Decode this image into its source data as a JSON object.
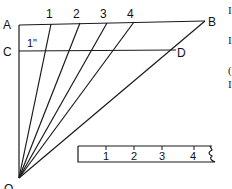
{
  "diagram": {
    "points": {
      "A": {
        "label": "A",
        "x": 19,
        "y": 25
      },
      "B": {
        "label": "B",
        "x": 205,
        "y": 21
      },
      "C": {
        "label": "C",
        "x": 19,
        "y": 51
      },
      "D": {
        "label": "D",
        "x": 176,
        "y": 50
      },
      "O": {
        "label": "O",
        "x": 19,
        "y": 180
      }
    },
    "division_labels": [
      "1",
      "2",
      "3",
      "4"
    ],
    "inch_label": "1\"",
    "ruler": {
      "tick_labels": [
        "1",
        "2",
        "3",
        "4"
      ]
    },
    "edge_text": [
      "I",
      "I",
      "(",
      "I"
    ],
    "colors": {
      "stroke": "#1a1a1a",
      "background": "#ffffff"
    }
  }
}
